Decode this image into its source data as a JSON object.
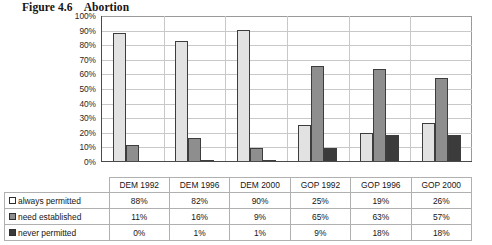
{
  "figure": {
    "number": "Figure 4.6",
    "title": "Abortion"
  },
  "chart_data": {
    "type": "bar",
    "title": "Abortion",
    "xlabel": "",
    "ylabel": "",
    "ylim": [
      0,
      100
    ],
    "ytick_labels": [
      "100%",
      "90%",
      "80%",
      "70%",
      "60%",
      "50%",
      "40%",
      "30%",
      "20%",
      "10%",
      "0%"
    ],
    "ytick_values": [
      100,
      90,
      80,
      70,
      60,
      50,
      40,
      30,
      20,
      10,
      0
    ],
    "grid": true,
    "legend_position": "table-below",
    "categories": [
      "DEM 1992",
      "DEM 1996",
      "DEM 2000",
      "GOP 1992",
      "GOP 1996",
      "GOP 2000"
    ],
    "series": [
      {
        "name": "always permitted",
        "color": "#e2e2e2",
        "values": [
          88,
          82,
          90,
          25,
          19,
          26
        ],
        "labels": [
          "88%",
          "82%",
          "90%",
          "25%",
          "19%",
          "26%"
        ]
      },
      {
        "name": "need established",
        "color": "#8e8e8e",
        "values": [
          11,
          16,
          9,
          65,
          63,
          57
        ],
        "labels": [
          "11%",
          "16%",
          "9%",
          "65%",
          "63%",
          "57%"
        ]
      },
      {
        "name": "never permitted",
        "color": "#3b3b3b",
        "values": [
          0,
          1,
          1,
          9,
          18,
          18
        ],
        "labels": [
          "0%",
          "1%",
          "1%",
          "9%",
          "18%",
          "18%"
        ]
      }
    ]
  },
  "colors": {
    "series_always": "#e2e2e2",
    "series_need": "#8e8e8e",
    "series_never": "#3b3b3b",
    "axis": "#4a4a4a",
    "grid": "#c8c8c8",
    "table_border": "#b0b0b0"
  }
}
